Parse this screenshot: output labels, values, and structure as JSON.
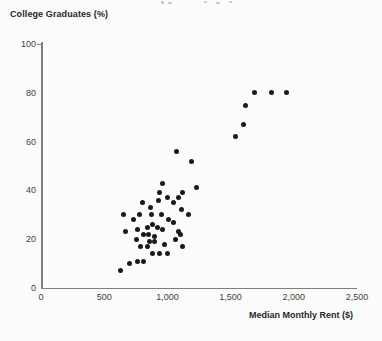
{
  "chart": {
    "y_axis_title": "College Graduates (%)",
    "x_axis_title": "Median Monthly Rent ($)",
    "y_tick_labels": [
      "100",
      "80",
      "60",
      "40",
      "20",
      "0"
    ],
    "x_tick_labels": [
      "0",
      "500",
      "1,000",
      "1,500",
      "2,000",
      "2,500"
    ]
  },
  "colors": {
    "dot": "#1a1a1a",
    "axis_line": "#7f7f7f",
    "tick_label": "#3f3f3f",
    "axis_title": "#262626"
  },
  "chart_data": {
    "type": "scatter",
    "title": "",
    "xlabel": "Median Monthly Rent ($)",
    "ylabel": "College Graduates (%)",
    "xlim": [
      0,
      2500
    ],
    "ylim": [
      0,
      100
    ],
    "x_ticks": [
      0,
      500,
      1000,
      1500,
      2000,
      2500
    ],
    "y_ticks": [
      0,
      20,
      40,
      60,
      80,
      100
    ],
    "grid": false,
    "legend_position": "none",
    "points": [
      [
        625,
        7
      ],
      [
        655,
        30
      ],
      [
        670,
        23
      ],
      [
        700,
        10
      ],
      [
        730,
        28
      ],
      [
        755,
        20
      ],
      [
        765,
        11
      ],
      [
        765,
        24
      ],
      [
        780,
        30
      ],
      [
        790,
        17
      ],
      [
        805,
        35
      ],
      [
        810,
        11
      ],
      [
        810,
        22
      ],
      [
        840,
        17
      ],
      [
        845,
        25
      ],
      [
        850,
        22
      ],
      [
        860,
        19
      ],
      [
        865,
        33
      ],
      [
        875,
        30
      ],
      [
        880,
        14
      ],
      [
        885,
        26
      ],
      [
        895,
        21
      ],
      [
        900,
        19
      ],
      [
        920,
        25
      ],
      [
        930,
        36
      ],
      [
        940,
        14
      ],
      [
        940,
        39
      ],
      [
        950,
        30
      ],
      [
        960,
        24
      ],
      [
        965,
        43
      ],
      [
        975,
        18
      ],
      [
        1000,
        14
      ],
      [
        1000,
        37
      ],
      [
        1010,
        28
      ],
      [
        1050,
        27
      ],
      [
        1050,
        35
      ],
      [
        1065,
        20
      ],
      [
        1075,
        56
      ],
      [
        1090,
        23
      ],
      [
        1090,
        37
      ],
      [
        1105,
        22
      ],
      [
        1110,
        32
      ],
      [
        1120,
        17
      ],
      [
        1120,
        39
      ],
      [
        1165,
        30
      ],
      [
        1190,
        52
      ],
      [
        1230,
        41
      ],
      [
        1540,
        62
      ],
      [
        1605,
        67
      ],
      [
        1615,
        75
      ],
      [
        1690,
        80
      ],
      [
        1820,
        80
      ],
      [
        1940,
        80
      ]
    ]
  }
}
